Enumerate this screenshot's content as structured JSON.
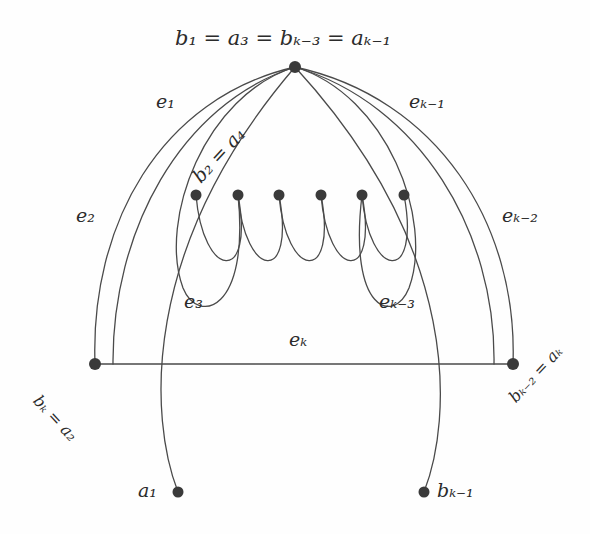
{
  "figure": {
    "width": 590,
    "height": 534,
    "background_color": "#fefefe",
    "stroke_color": "#4a4a4a",
    "vertex_color": "#3a3a3a",
    "text_color": "#2b2b2b",
    "stroke_width": 1.3,
    "vertex_radius": 5
  },
  "vertices": [
    {
      "id": "apex",
      "x": 295,
      "y": 67,
      "name": "apex-vertex"
    },
    {
      "id": "left",
      "x": 95,
      "y": 364,
      "name": "left-vertex"
    },
    {
      "id": "right",
      "x": 513,
      "y": 364,
      "name": "right-vertex"
    },
    {
      "id": "m1",
      "x": 196,
      "y": 195,
      "name": "middle-vertex-1"
    },
    {
      "id": "m2",
      "x": 238,
      "y": 195,
      "name": "middle-vertex-2"
    },
    {
      "id": "m3",
      "x": 279,
      "y": 195,
      "name": "middle-vertex-3"
    },
    {
      "id": "m4",
      "x": 321,
      "y": 195,
      "name": "middle-vertex-4"
    },
    {
      "id": "m5",
      "x": 362,
      "y": 195,
      "name": "middle-vertex-5"
    },
    {
      "id": "m6",
      "x": 404,
      "y": 195,
      "name": "middle-vertex-6"
    },
    {
      "id": "a1",
      "x": 178,
      "y": 492,
      "name": "pendant-vertex-a1"
    },
    {
      "id": "bk1",
      "x": 424,
      "y": 492,
      "name": "pendant-vertex-bk-1"
    }
  ],
  "vertex_labels": {
    "apex": {
      "text": "b₁ = a₃ = bₖ₋₃ = aₖ₋₁",
      "x": 175,
      "y": 28,
      "rotation": 0
    },
    "left": {
      "text": "bₖ = a₂",
      "x": 36,
      "y": 390,
      "rotation": 47
    },
    "right": {
      "text": "bₖ₋₂ = aₖ",
      "x": 512,
      "y": 392,
      "rotation": -47
    },
    "middle": {
      "text": "b₂ = a₄",
      "x": 196,
      "y": 170,
      "rotation": -47
    },
    "a1": {
      "text": "a₁",
      "x": 138,
      "y": 481,
      "rotation": 0
    },
    "bk1": {
      "text": "bₖ₋₁",
      "x": 437,
      "y": 481,
      "rotation": 0
    }
  },
  "edge_labels": [
    {
      "id": "e1",
      "text": "e₁",
      "x": 156,
      "y": 92,
      "name": "edge-label-e1"
    },
    {
      "id": "e2",
      "text": "e₂",
      "x": 76,
      "y": 206,
      "name": "edge-label-e2"
    },
    {
      "id": "e3",
      "text": "e₃",
      "x": 184,
      "y": 292,
      "name": "edge-label-e3"
    },
    {
      "id": "ek3",
      "text": "eₖ₋₃",
      "x": 379,
      "y": 292,
      "name": "edge-label-ek-3"
    },
    {
      "id": "ek2",
      "text": "eₖ₋₂",
      "x": 502,
      "y": 206,
      "name": "edge-label-ek-2"
    },
    {
      "id": "ek1",
      "text": "eₖ₋₁",
      "x": 409,
      "y": 92,
      "name": "edge-label-ek-1"
    },
    {
      "id": "ek",
      "text": "eₖ",
      "x": 289,
      "y": 330,
      "name": "edge-label-ek"
    }
  ],
  "graph_data": {
    "type": "multigraph-diagram",
    "description": "Eulerian-type cycle decomposition diagram with edges e1..ek",
    "edge_count_label": "k",
    "edges": [
      {
        "label": "e₁",
        "from": "left",
        "to": "apex",
        "shape": "outer-arc"
      },
      {
        "label": "e₂",
        "from": "left",
        "to": "apex",
        "shape": "outer-arc"
      },
      {
        "label": "e₃",
        "from": "apex",
        "to": "m2",
        "shape": "loop-arc"
      },
      {
        "label": "eₖ₋₃",
        "from": "apex",
        "to": "m5",
        "shape": "loop-arc"
      },
      {
        "label": "eₖ₋₂",
        "from": "right",
        "to": "apex",
        "shape": "outer-arc"
      },
      {
        "label": "eₖ₋₁",
        "from": "right",
        "to": "apex",
        "shape": "outer-arc"
      },
      {
        "label": "eₖ",
        "from": "left",
        "to": "right",
        "shape": "straight"
      }
    ]
  }
}
